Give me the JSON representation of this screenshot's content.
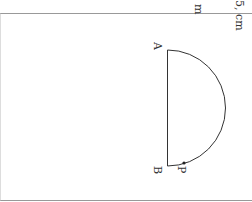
{
  "diagram": {
    "points": {
      "A": {
        "label": "A"
      },
      "B": {
        "label": "B"
      },
      "P": {
        "label": "P"
      }
    },
    "top_text_fragments": [
      "m",
      "5, cm"
    ],
    "colors": {
      "stroke": "#333333",
      "border": "#888888",
      "background": "#ffffff"
    }
  }
}
